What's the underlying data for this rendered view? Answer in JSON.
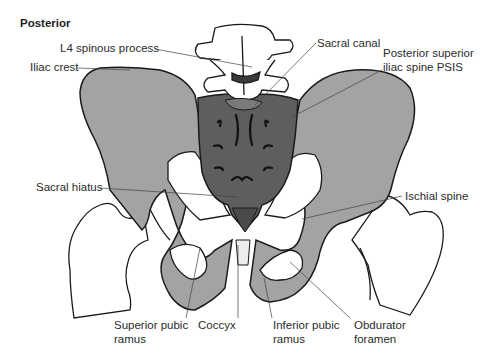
{
  "view_title": "Posterior",
  "colors": {
    "ilium": "#a3a3a3",
    "sacrum": "#5e5e5e",
    "outline": "#1a1a1a",
    "bone_white": "#ffffff",
    "leader": "#444444",
    "text": "#2b2b2b"
  },
  "labels": {
    "l4_spinous_process": "L4 spinous process",
    "iliac_crest": "Iliac crest",
    "sacral_canal": "Sacral canal",
    "psis": "Posterior superior\niliac spine PSIS",
    "sacral_hiatus": "Sacral hiatus",
    "ischial_spine": "Ischial spine",
    "superior_pubic_ramus": "Superior pubic\nramus",
    "coccyx": "Coccyx",
    "inferior_pubic_ramus": "Inferior pubic\nramus",
    "obturator_foramen": "Obdurator\nforamen"
  }
}
